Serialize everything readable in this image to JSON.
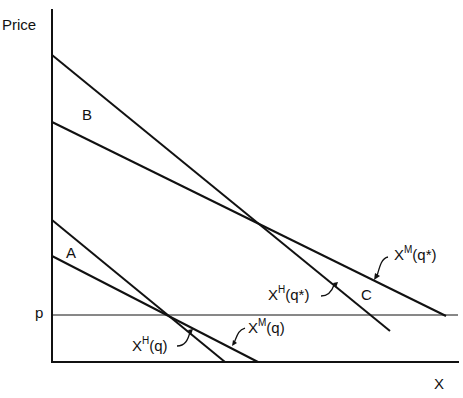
{
  "axes": {
    "y_label": "Price",
    "x_label": "X",
    "price_level_label": "p"
  },
  "regions": {
    "a": "A",
    "b": "B",
    "c": "C"
  },
  "curves": {
    "hicksian_q": {
      "base": "X",
      "sup": "H",
      "arg": "(q)"
    },
    "marshallian_q": {
      "base": "X",
      "sup": "M",
      "arg": "(q)"
    },
    "hicksian_qstar": {
      "base": "X",
      "sup": "H",
      "arg": "(q*)"
    },
    "marshallian_qstar": {
      "base": "X",
      "sup": "M",
      "arg": "(q*)"
    }
  },
  "colors": {
    "ink": "#111111",
    "background": "#ffffff"
  }
}
